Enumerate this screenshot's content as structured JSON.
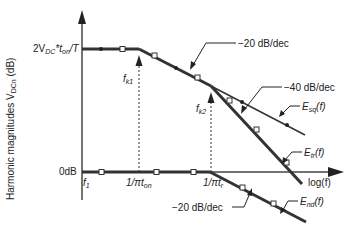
{
  "diagram": {
    "y_axis_label": "Harmonic magnitudes V",
    "y_axis_label_sub": "DCn",
    "y_axis_label_unit": " (dB)",
    "y_top_label_main": "2V",
    "y_top_label_sub1": "DC",
    "y_top_label_mid": "*t",
    "y_top_label_sub2": "on",
    "y_top_label_end": "/T",
    "y_zero_label": "0dB",
    "x_axis_label": "log(f)",
    "x_tick_f1": "f",
    "x_tick_f1_sub": "1",
    "x_tick_ton": "1/πt",
    "x_tick_ton_sub": "on",
    "x_tick_tr": "1/πt",
    "x_tick_tr_sub": "r",
    "fk1_label": "f",
    "fk1_sub": "k1",
    "fk2_label": "f",
    "fk2_sub": "k2",
    "slope_20_top": "−20 dB/dec",
    "slope_40": "−40 dB/dec",
    "slope_20_bottom": "−20 dB/dec",
    "curve_esq": "E",
    "curve_esq_sub": "sq",
    "curve_esq_end": "(f)",
    "curve_etr": "E",
    "curve_etr_sub": "tr",
    "curve_etr_end": "(f)",
    "curve_end": "E",
    "curve_end_sub": "nd",
    "curve_end_end": "(f)"
  },
  "colors": {
    "line": "#222222",
    "thick_line": "#333333",
    "marker_fill": "#ffffff"
  }
}
